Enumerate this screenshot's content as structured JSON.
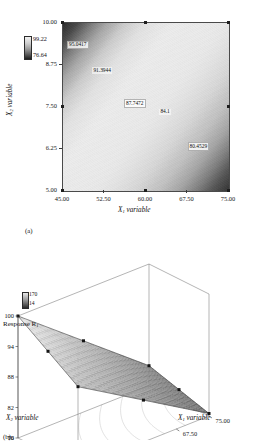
{
  "figure": {
    "panel_a_label": "(a)",
    "panel_b_label": "(b)"
  },
  "chart_data": [
    {
      "type": "heatmap",
      "panel": "(a)",
      "title": "",
      "xlabel": "X1 variable",
      "ylabel": "X2 variable",
      "xlabel_base": "X",
      "xlabel_sub": "1",
      "xlabel_tail": " variable",
      "ylabel_base": "X",
      "ylabel_sub": "2",
      "ylabel_tail": " variable",
      "xlim": [
        45.0,
        75.0
      ],
      "ylim": [
        5.0,
        10.0
      ],
      "xticks": [
        "45.00",
        "52.50",
        "60.00",
        "67.50",
        "75.00"
      ],
      "yticks": [
        "10.00",
        "8.75",
        "7.50",
        "6.25",
        "5.00"
      ],
      "grid": false,
      "colorbar": {
        "max": "99.22",
        "min": "76.64"
      },
      "contour_labels": [
        {
          "value": "95.0417",
          "x": 45.9,
          "y": 9.34,
          "boxed": true
        },
        {
          "value": "91.3944",
          "x": 50.5,
          "y": 8.55,
          "boxed": false
        },
        {
          "value": "87.7472",
          "x": 56.2,
          "y": 7.6,
          "boxed": true
        },
        {
          "value": "84.1",
          "x": 62.6,
          "y": 7.32,
          "boxed": false
        },
        {
          "value": "80.4529",
          "x": 67.7,
          "y": 6.31,
          "boxed": true
        }
      ],
      "corner_markers": [
        {
          "x": 45.0,
          "y": 10.0
        },
        {
          "x": 60.0,
          "y": 10.0
        },
        {
          "x": 75.0,
          "y": 10.0
        },
        {
          "x": 45.0,
          "y": 7.5
        },
        {
          "x": 75.0,
          "y": 7.5
        },
        {
          "x": 45.0,
          "y": 5.0
        },
        {
          "x": 60.0,
          "y": 5.0
        },
        {
          "x": 75.0,
          "y": 5.0
        }
      ]
    },
    {
      "type": "surface",
      "panel": "(b)",
      "title": "",
      "zlabel": "Response R1",
      "zlabel_base": "Response R",
      "zlabel_sub": "1",
      "xlabel_base": "X",
      "xlabel_sub": "1",
      "xlabel_tail": " variable",
      "ylabel_base": "X",
      "ylabel_sub": "2",
      "ylabel_tail": " variable",
      "xticks": [
        "45.00",
        "52.50",
        "60.00",
        "67.50",
        "75.00"
      ],
      "yticks": [
        "10",
        "8.75",
        "7.50",
        "6.25",
        "5.00"
      ],
      "zticks": [
        "100",
        "94",
        "88",
        "82",
        "76"
      ],
      "zlim": [
        76,
        100
      ],
      "xlim": [
        45.0,
        75.0
      ],
      "ylim": [
        5.0,
        10.0
      ],
      "colorbar": {
        "max": "170",
        "min": "14"
      },
      "surface_corners": {
        "x45_y10": 100.0,
        "x75_y10": 80.0,
        "x45_y5": 92.0,
        "x75_y5": 76.5
      },
      "data_points": [
        {
          "x": 45.0,
          "y": 10.0,
          "z": 100.0
        },
        {
          "x": 60.0,
          "y": 10.0,
          "z": 92.0
        },
        {
          "x": 75.0,
          "y": 10.0,
          "z": 80.0
        },
        {
          "x": 45.0,
          "y": 7.5,
          "z": 94.0
        },
        {
          "x": 75.0,
          "y": 7.5,
          "z": 79.0
        },
        {
          "x": 45.0,
          "y": 5.0,
          "z": 88.0
        },
        {
          "x": 60.0,
          "y": 5.0,
          "z": 82.0
        },
        {
          "x": 75.0,
          "y": 5.0,
          "z": 76.5
        }
      ]
    }
  ]
}
